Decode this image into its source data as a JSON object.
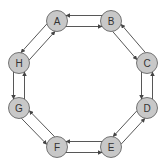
{
  "diagram": {
    "type": "ring-graph",
    "node_fill": "#c8c8c8",
    "node_stroke": "#666666",
    "edge_color": "#444444",
    "nodes": [
      {
        "id": "A",
        "label": "A",
        "x": 57,
        "y": 21
      },
      {
        "id": "B",
        "label": "B",
        "x": 111,
        "y": 21
      },
      {
        "id": "C",
        "label": "C",
        "x": 147,
        "y": 63
      },
      {
        "id": "D",
        "label": "D",
        "x": 147,
        "y": 108
      },
      {
        "id": "E",
        "label": "E",
        "x": 111,
        "y": 147
      },
      {
        "id": "F",
        "label": "F",
        "x": 57,
        "y": 147
      },
      {
        "id": "G",
        "label": "G",
        "x": 19,
        "y": 108
      },
      {
        "id": "H",
        "label": "H",
        "x": 19,
        "y": 63
      }
    ],
    "edges": [
      {
        "from": "A",
        "to": "B"
      },
      {
        "from": "B",
        "to": "A"
      },
      {
        "from": "B",
        "to": "C"
      },
      {
        "from": "C",
        "to": "B"
      },
      {
        "from": "C",
        "to": "D"
      },
      {
        "from": "D",
        "to": "C"
      },
      {
        "from": "D",
        "to": "E"
      },
      {
        "from": "E",
        "to": "D"
      },
      {
        "from": "E",
        "to": "F"
      },
      {
        "from": "F",
        "to": "E"
      },
      {
        "from": "F",
        "to": "G"
      },
      {
        "from": "G",
        "to": "F"
      },
      {
        "from": "G",
        "to": "H"
      },
      {
        "from": "H",
        "to": "G"
      },
      {
        "from": "H",
        "to": "A"
      },
      {
        "from": "A",
        "to": "H"
      }
    ]
  }
}
